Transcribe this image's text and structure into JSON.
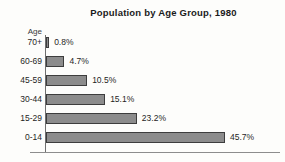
{
  "chart_data": {
    "type": "bar",
    "orientation": "horizontal",
    "title": "Population by Age Group, 1980",
    "xlabel": "",
    "ylabel": "Age",
    "categories": [
      "70+",
      "60-69",
      "45-59",
      "30-44",
      "15-29",
      "0-14"
    ],
    "values": [
      0.8,
      4.7,
      10.5,
      15.1,
      23.2,
      45.7
    ],
    "value_labels": [
      "0.8%",
      "4.7%",
      "10.5%",
      "15.1%",
      "23.2%",
      "45.7%"
    ],
    "xlim": [
      0,
      45.7
    ],
    "grid": false,
    "legend": null,
    "bar_color": "#8c8c8c",
    "bar_border_color": "#3d3d3d",
    "axis_color": "#6f6f6f",
    "text_color": "#1f1f1f",
    "background": "#fdfdfb"
  },
  "axis": {
    "y_title": "Age"
  },
  "header": {
    "title": "Population by Age Group, 1980"
  }
}
